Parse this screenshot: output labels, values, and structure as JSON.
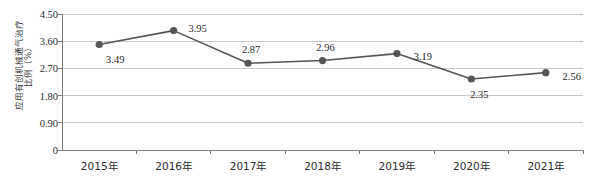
{
  "chart_data": {
    "type": "line",
    "title": "",
    "xlabel": "",
    "ylabel": "应用有创机械通气治疗比例（%）",
    "ylabel_lines": [
      "应用有创机械通气治疗",
      "比例（%）"
    ],
    "categories": [
      "2015年",
      "2016年",
      "2017年",
      "2018年",
      "2019年",
      "2020年",
      "2021年"
    ],
    "values": [
      3.49,
      3.95,
      2.87,
      2.96,
      3.19,
      2.35,
      2.56
    ],
    "value_labels": [
      "3.49",
      "3.95",
      "2.87",
      "2.96",
      "3.19",
      "2.35",
      "2.56"
    ],
    "ylim": [
      0,
      4.5
    ],
    "yticks": [
      0,
      0.9,
      1.8,
      2.7,
      3.6,
      4.5
    ],
    "ytick_labels": [
      "0",
      "0.90",
      "1.80",
      "2.70",
      "3.60",
      "4.50"
    ],
    "grid": true,
    "grid_axis": "y",
    "legend": "none",
    "series_color": "#555555",
    "marker": "circle",
    "marker_color": "#555555",
    "gridline_color": "#c8c8c8",
    "axis_color": "#7a7a7a",
    "label_offsets": [
      {
        "dx": 16,
        "dy": 14
      },
      {
        "dx": 24,
        "dy": -3
      },
      {
        "dx": 3,
        "dy": -14
      },
      {
        "dx": 3,
        "dy": -14
      },
      {
        "dx": 26,
        "dy": 2
      },
      {
        "dx": 8,
        "dy": 15
      },
      {
        "dx": 26,
        "dy": 3
      }
    ]
  }
}
